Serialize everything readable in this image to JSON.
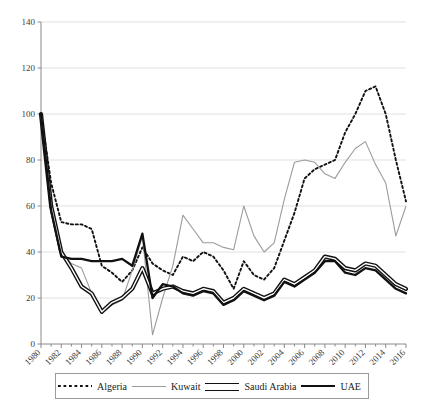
{
  "chart_data": {
    "type": "line",
    "title": "",
    "xlabel": "",
    "ylabel": "",
    "xlim": [
      1980,
      2016
    ],
    "ylim": [
      0,
      140
    ],
    "ytick_step": 20,
    "yticks": [
      0,
      20,
      40,
      60,
      80,
      100,
      120,
      140
    ],
    "xticks": [
      1980,
      1982,
      1984,
      1986,
      1988,
      1990,
      1992,
      1994,
      1996,
      1998,
      2000,
      2002,
      2004,
      2006,
      2008,
      2010,
      2012,
      2014,
      2016
    ],
    "x": [
      1980,
      1981,
      1982,
      1983,
      1984,
      1985,
      1986,
      1987,
      1988,
      1989,
      1990,
      1991,
      1992,
      1993,
      1994,
      1995,
      1996,
      1997,
      1998,
      1999,
      2000,
      2001,
      2002,
      2003,
      2004,
      2005,
      2006,
      2007,
      2008,
      2009,
      2010,
      2011,
      2012,
      2013,
      2014,
      2015,
      2016
    ],
    "grid": "horizontal",
    "legend_position": "bottom",
    "series": [
      {
        "name": "Algeria",
        "style": "dotted",
        "color": "#111111",
        "values": [
          100,
          70,
          53,
          52,
          52,
          50,
          34,
          31,
          27,
          32,
          42,
          35,
          32,
          30,
          38,
          36,
          40,
          38,
          32,
          24,
          36,
          30,
          28,
          33,
          45,
          57,
          72,
          76,
          78,
          80,
          92,
          100,
          110,
          112,
          100,
          80,
          62
        ]
      },
      {
        "name": "Kuwait",
        "style": "thin",
        "color": "#9b9b9b",
        "values": [
          100,
          62,
          40,
          35,
          33,
          22,
          14,
          17,
          19,
          32,
          47,
          4,
          20,
          34,
          56,
          50,
          44,
          44,
          42,
          41,
          60,
          47,
          40,
          44,
          63,
          79,
          80,
          79,
          74,
          72,
          79,
          85,
          88,
          78,
          70,
          47,
          60
        ]
      },
      {
        "name": "Saudi Arabia",
        "style": "double",
        "color": "#111111",
        "values": [
          100,
          60,
          40,
          33,
          25,
          22,
          14,
          18,
          20,
          24,
          33,
          22,
          24,
          25,
          23,
          22,
          24,
          23,
          18,
          20,
          24,
          22,
          20,
          22,
          28,
          26,
          29,
          32,
          38,
          37,
          33,
          32,
          35,
          34,
          30,
          26,
          24
        ]
      },
      {
        "name": "UAE",
        "style": "thick",
        "color": "#111111",
        "values": [
          100,
          58,
          38,
          37,
          37,
          36,
          36,
          36,
          37,
          34,
          48,
          20,
          26,
          25,
          22,
          21,
          23,
          22,
          17,
          19,
          23,
          21,
          19,
          21,
          27,
          25,
          28,
          31,
          36,
          36,
          31,
          30,
          33,
          32,
          28,
          24,
          22
        ]
      }
    ]
  },
  "legend": {
    "items": [
      {
        "label": "Algeria"
      },
      {
        "label": "Kuwait"
      },
      {
        "label": "Saudi Arabia"
      },
      {
        "label": "UAE"
      }
    ]
  }
}
